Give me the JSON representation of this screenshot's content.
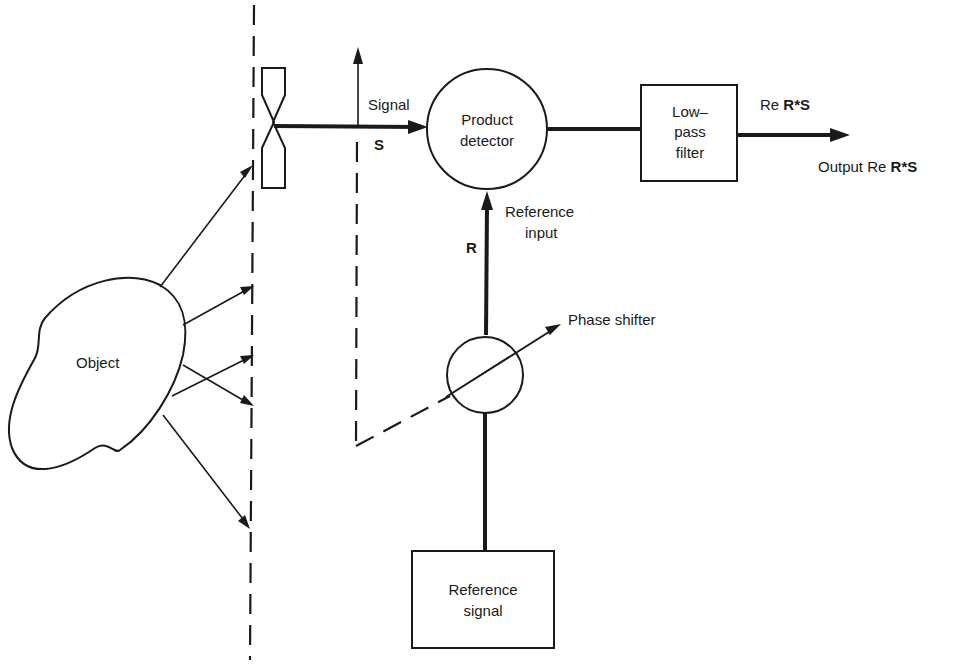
{
  "diagram": {
    "blocks": {
      "object": {
        "label": "Object"
      },
      "product_detector": {
        "line1": "Product",
        "line2": "detector"
      },
      "low_pass_filter": {
        "line1": "Low–",
        "line2": "pass",
        "line3": "filter"
      },
      "reference_signal": {
        "line1": "Reference",
        "line2": "signal"
      },
      "phase_shifter": {
        "label": "Phase shifter"
      }
    },
    "labels": {
      "signal": "Signal",
      "signal_symbol": "S",
      "reference_input_line1": "Reference",
      "reference_input_line2": "input",
      "reference_symbol": "R",
      "filter_output_prefix": "Re ",
      "filter_output_expr": "R*S",
      "output_prefix": "Output Re ",
      "output_expr": "R*S"
    },
    "connections": [
      {
        "from": "object",
        "to": "detector-plane",
        "type": "scattered-rays",
        "count": 5
      },
      {
        "from": "sensor",
        "to": "product_detector",
        "label": "Signal S"
      },
      {
        "from": "reference_signal",
        "to": "phase_shifter"
      },
      {
        "from": "phase_shifter",
        "to": "product_detector",
        "label": "R (Reference input)"
      },
      {
        "from": "product_detector",
        "to": "low_pass_filter"
      },
      {
        "from": "low_pass_filter",
        "to": "output",
        "label": "Re R*S"
      }
    ],
    "colors": {
      "ink": "#1a1a1a",
      "background": "#ffffff"
    }
  }
}
